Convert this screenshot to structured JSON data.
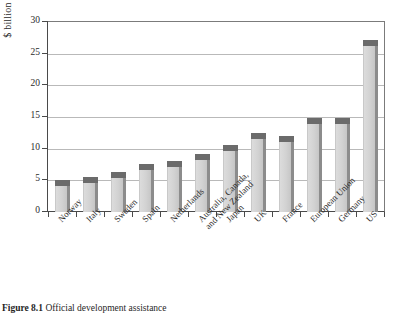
{
  "chart_data": {
    "type": "bar",
    "title": "",
    "xlabel": "",
    "ylabel": "$ billion",
    "ylim": [
      0,
      30
    ],
    "yticks": [
      0,
      5,
      10,
      15,
      20,
      25,
      30
    ],
    "grid": true,
    "legend": "none",
    "categories": [
      "Norway",
      "Italy",
      "Sweden",
      "Spain",
      "Netherlands",
      "Australia, Canada, and New Zealand",
      "Japan",
      "UK",
      "France",
      "European Union",
      "Germany",
      "US"
    ],
    "values": [
      4.3,
      4.8,
      5.5,
      6.8,
      7.2,
      8.3,
      9.8,
      11.7,
      11.2,
      14.0,
      14.0,
      26.3
    ]
  },
  "axis": {
    "y_title": "$ billion",
    "y_tick_labels": [
      "30",
      "25",
      "20",
      "15",
      "10",
      "5",
      "0"
    ]
  },
  "x_labels": [
    {
      "line1": "Norway",
      "line2": ""
    },
    {
      "line1": "Italy",
      "line2": ""
    },
    {
      "line1": "Sweden",
      "line2": ""
    },
    {
      "line1": "Spain",
      "line2": ""
    },
    {
      "line1": "Netherlands",
      "line2": ""
    },
    {
      "line1": "Australia, Canada,",
      "line2": "and New Zealand"
    },
    {
      "line1": "Japan",
      "line2": ""
    },
    {
      "line1": "UK",
      "line2": ""
    },
    {
      "line1": "France",
      "line2": ""
    },
    {
      "line1": "European Union",
      "line2": ""
    },
    {
      "line1": "Germany",
      "line2": ""
    },
    {
      "line1": "US",
      "line2": ""
    }
  ],
  "caption": {
    "number": "Figure 8.1",
    "text": "Official development assistance"
  },
  "colors": {
    "bar_face": "#d2d2d2",
    "bar_shadow": "#8c8c8c",
    "bar_cap": "#6b6b6b",
    "gridline": "#b9b9b9",
    "axis": "#4a4a4a"
  }
}
